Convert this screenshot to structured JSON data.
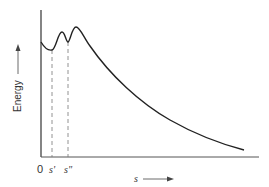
{
  "figure": {
    "type": "energy-profile",
    "y_axis_label": "Energy",
    "x_axis_label": "s",
    "origin_label": "0",
    "markers": [
      {
        "label": "s'",
        "kind": "local-minimum"
      },
      {
        "label": "s\"",
        "kind": "intermediate-minimum"
      }
    ],
    "curve_description": "Energy starts moderately high at s=0, dips to a minimum at s', rises to a first barrier, dips to a shallower minimum at s'', rises to a higher barrier, then decays monotonically toward zero as s increases.",
    "colors": {
      "line": "#222222",
      "background": "#ffffff"
    }
  }
}
